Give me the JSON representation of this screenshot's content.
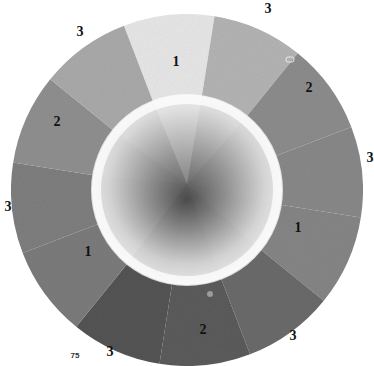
{
  "image": {
    "subject": "Pencil-shaded grayscale value wheel",
    "background": "#ffffff"
  },
  "wheel": {
    "center": [
      187,
      190
    ],
    "outer_radius": 176,
    "inner_radius": 95,
    "start_angle_deg": -21,
    "segments": [
      {
        "label": "1",
        "color": "#e6e6e6",
        "label_pos": [
          176,
          62
        ]
      },
      {
        "label": "",
        "color": "#b3b3b3",
        "label_pos": [
          0,
          0
        ]
      },
      {
        "label": "2",
        "color": "#8c8c8c",
        "label_pos": [
          309,
          88
        ]
      },
      {
        "label": "",
        "color": "#888888",
        "label_pos": [
          0,
          0
        ]
      },
      {
        "label": "1",
        "color": "#858585",
        "label_pos": [
          298,
          228
        ]
      },
      {
        "label": "",
        "color": "#6a6a6a",
        "label_pos": [
          0,
          0
        ]
      },
      {
        "label": "2",
        "color": "#5b5b5b",
        "label_pos": [
          203,
          330
        ]
      },
      {
        "label": "",
        "color": "#545454",
        "label_pos": [
          0,
          0
        ]
      },
      {
        "label": "1",
        "color": "#7b7b7b",
        "label_pos": [
          88,
          252
        ]
      },
      {
        "label": "",
        "color": "#7e7e7e",
        "label_pos": [
          0,
          0
        ]
      },
      {
        "label": "2",
        "color": "#8f8f8f",
        "label_pos": [
          57,
          122
        ]
      },
      {
        "label": "",
        "color": "#a9a9a9",
        "label_pos": [
          0,
          0
        ]
      }
    ],
    "inner_disc": {
      "highlight": "#fafafa",
      "shadow": "#5a5a5a"
    }
  },
  "outer_labels": [
    {
      "text": "3",
      "pos": [
        80,
        32
      ]
    },
    {
      "text": "3",
      "pos": [
        268,
        9
      ]
    },
    {
      "text": "3",
      "pos": [
        370,
        158
      ]
    },
    {
      "text": "3",
      "pos": [
        8,
        207
      ]
    },
    {
      "text": "3",
      "pos": [
        293,
        336
      ]
    },
    {
      "text": "3",
      "pos": [
        110,
        352
      ]
    }
  ],
  "footnote": {
    "text": "75",
    "pos": [
      75,
      356
    ]
  },
  "marks": [
    {
      "shape": "rounded-rect",
      "pos": [
        290,
        60
      ]
    },
    {
      "shape": "dot",
      "pos": [
        210,
        294
      ]
    }
  ]
}
